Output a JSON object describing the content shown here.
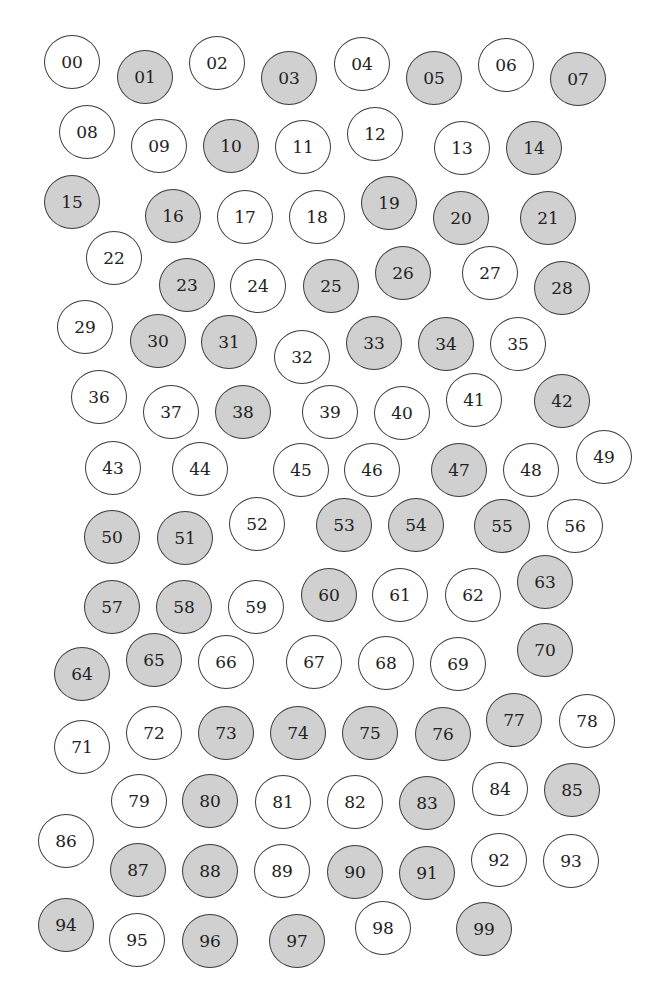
{
  "colors": {
    "background": "#ffffff",
    "shaded_fill": "#d0d0d0",
    "unshaded_fill": "#ffffff",
    "stroke": "#3a3a3a",
    "text": "#222222"
  },
  "circles": [
    {
      "label": "00",
      "x": 72,
      "y": 62,
      "shaded": false
    },
    {
      "label": "01",
      "x": 145,
      "y": 77,
      "shaded": true
    },
    {
      "label": "02",
      "x": 217,
      "y": 63,
      "shaded": false
    },
    {
      "label": "03",
      "x": 289,
      "y": 78,
      "shaded": true
    },
    {
      "label": "04",
      "x": 362,
      "y": 64,
      "shaded": false
    },
    {
      "label": "05",
      "x": 434,
      "y": 78,
      "shaded": true
    },
    {
      "label": "06",
      "x": 506,
      "y": 65,
      "shaded": false
    },
    {
      "label": "07",
      "x": 578,
      "y": 79,
      "shaded": true
    },
    {
      "label": "08",
      "x": 87,
      "y": 132,
      "shaded": false
    },
    {
      "label": "09",
      "x": 159,
      "y": 146,
      "shaded": false
    },
    {
      "label": "10",
      "x": 231,
      "y": 146,
      "shaded": true
    },
    {
      "label": "11",
      "x": 303,
      "y": 147,
      "shaded": false
    },
    {
      "label": "12",
      "x": 375,
      "y": 134,
      "shaded": false
    },
    {
      "label": "13",
      "x": 462,
      "y": 148,
      "shaded": false
    },
    {
      "label": "14",
      "x": 534,
      "y": 148,
      "shaded": true
    },
    {
      "label": "15",
      "x": 72,
      "y": 202,
      "shaded": true
    },
    {
      "label": "16",
      "x": 173,
      "y": 216,
      "shaded": true
    },
    {
      "label": "17",
      "x": 245,
      "y": 217,
      "shaded": false
    },
    {
      "label": "18",
      "x": 317,
      "y": 217,
      "shaded": false
    },
    {
      "label": "19",
      "x": 389,
      "y": 203,
      "shaded": true
    },
    {
      "label": "20",
      "x": 461,
      "y": 218,
      "shaded": true
    },
    {
      "label": "21",
      "x": 548,
      "y": 218,
      "shaded": true
    },
    {
      "label": "22",
      "x": 114,
      "y": 258,
      "shaded": false
    },
    {
      "label": "23",
      "x": 187,
      "y": 285,
      "shaded": true
    },
    {
      "label": "24",
      "x": 258,
      "y": 286,
      "shaded": false
    },
    {
      "label": "25",
      "x": 331,
      "y": 286,
      "shaded": true
    },
    {
      "label": "26",
      "x": 403,
      "y": 273,
      "shaded": true
    },
    {
      "label": "27",
      "x": 490,
      "y": 273,
      "shaded": false
    },
    {
      "label": "28",
      "x": 562,
      "y": 288,
      "shaded": true
    },
    {
      "label": "29",
      "x": 85,
      "y": 327,
      "shaded": false
    },
    {
      "label": "30",
      "x": 158,
      "y": 341,
      "shaded": true
    },
    {
      "label": "31",
      "x": 229,
      "y": 342,
      "shaded": true
    },
    {
      "label": "32",
      "x": 302,
      "y": 357,
      "shaded": false
    },
    {
      "label": "33",
      "x": 374,
      "y": 343,
      "shaded": true
    },
    {
      "label": "34",
      "x": 446,
      "y": 344,
      "shaded": true
    },
    {
      "label": "35",
      "x": 518,
      "y": 344,
      "shaded": false
    },
    {
      "label": "36",
      "x": 99,
      "y": 397,
      "shaded": false
    },
    {
      "label": "37",
      "x": 171,
      "y": 412,
      "shaded": false
    },
    {
      "label": "38",
      "x": 243,
      "y": 412,
      "shaded": true
    },
    {
      "label": "39",
      "x": 330,
      "y": 412,
      "shaded": false
    },
    {
      "label": "40",
      "x": 402,
      "y": 413,
      "shaded": false
    },
    {
      "label": "41",
      "x": 474,
      "y": 400,
      "shaded": false
    },
    {
      "label": "42",
      "x": 562,
      "y": 401,
      "shaded": true
    },
    {
      "label": "43",
      "x": 113,
      "y": 468,
      "shaded": false
    },
    {
      "label": "44",
      "x": 200,
      "y": 469,
      "shaded": false
    },
    {
      "label": "45",
      "x": 301,
      "y": 470,
      "shaded": false
    },
    {
      "label": "46",
      "x": 372,
      "y": 470,
      "shaded": false
    },
    {
      "label": "47",
      "x": 459,
      "y": 470,
      "shaded": true
    },
    {
      "label": "48",
      "x": 531,
      "y": 470,
      "shaded": false
    },
    {
      "label": "49",
      "x": 604,
      "y": 457,
      "shaded": false
    },
    {
      "label": "50",
      "x": 112,
      "y": 537,
      "shaded": true
    },
    {
      "label": "51",
      "x": 185,
      "y": 538,
      "shaded": true
    },
    {
      "label": "52",
      "x": 257,
      "y": 524,
      "shaded": false
    },
    {
      "label": "53",
      "x": 344,
      "y": 525,
      "shaded": true
    },
    {
      "label": "54",
      "x": 416,
      "y": 525,
      "shaded": true
    },
    {
      "label": "55",
      "x": 502,
      "y": 526,
      "shaded": true
    },
    {
      "label": "56",
      "x": 575,
      "y": 526,
      "shaded": false
    },
    {
      "label": "57",
      "x": 112,
      "y": 607,
      "shaded": true
    },
    {
      "label": "58",
      "x": 184,
      "y": 607,
      "shaded": true
    },
    {
      "label": "59",
      "x": 256,
      "y": 607,
      "shaded": false
    },
    {
      "label": "60",
      "x": 329,
      "y": 595,
      "shaded": true
    },
    {
      "label": "61",
      "x": 400,
      "y": 595,
      "shaded": false
    },
    {
      "label": "62",
      "x": 473,
      "y": 595,
      "shaded": false
    },
    {
      "label": "63",
      "x": 545,
      "y": 582,
      "shaded": true
    },
    {
      "label": "64",
      "x": 82,
      "y": 674,
      "shaded": true
    },
    {
      "label": "65",
      "x": 154,
      "y": 660,
      "shaded": true
    },
    {
      "label": "66",
      "x": 226,
      "y": 662,
      "shaded": false
    },
    {
      "label": "67",
      "x": 314,
      "y": 662,
      "shaded": false
    },
    {
      "label": "68",
      "x": 386,
      "y": 663,
      "shaded": false
    },
    {
      "label": "69",
      "x": 458,
      "y": 664,
      "shaded": false
    },
    {
      "label": "70",
      "x": 545,
      "y": 650,
      "shaded": true
    },
    {
      "label": "71",
      "x": 82,
      "y": 747,
      "shaded": false
    },
    {
      "label": "72",
      "x": 154,
      "y": 733,
      "shaded": false
    },
    {
      "label": "73",
      "x": 226,
      "y": 733,
      "shaded": true
    },
    {
      "label": "74",
      "x": 298,
      "y": 733,
      "shaded": true
    },
    {
      "label": "75",
      "x": 370,
      "y": 733,
      "shaded": true
    },
    {
      "label": "76",
      "x": 443,
      "y": 734,
      "shaded": true
    },
    {
      "label": "77",
      "x": 514,
      "y": 720,
      "shaded": true
    },
    {
      "label": "78",
      "x": 587,
      "y": 721,
      "shaded": false
    },
    {
      "label": "79",
      "x": 139,
      "y": 801,
      "shaded": false
    },
    {
      "label": "80",
      "x": 210,
      "y": 801,
      "shaded": true
    },
    {
      "label": "81",
      "x": 283,
      "y": 802,
      "shaded": false
    },
    {
      "label": "82",
      "x": 355,
      "y": 802,
      "shaded": false
    },
    {
      "label": "83",
      "x": 427,
      "y": 803,
      "shaded": true
    },
    {
      "label": "84",
      "x": 500,
      "y": 789,
      "shaded": false
    },
    {
      "label": "85",
      "x": 572,
      "y": 790,
      "shaded": true
    },
    {
      "label": "86",
      "x": 66,
      "y": 841,
      "shaded": false
    },
    {
      "label": "87",
      "x": 138,
      "y": 870,
      "shaded": true
    },
    {
      "label": "88",
      "x": 210,
      "y": 871,
      "shaded": true
    },
    {
      "label": "89",
      "x": 282,
      "y": 871,
      "shaded": false
    },
    {
      "label": "90",
      "x": 355,
      "y": 872,
      "shaded": true
    },
    {
      "label": "91",
      "x": 427,
      "y": 873,
      "shaded": true
    },
    {
      "label": "92",
      "x": 499,
      "y": 860,
      "shaded": false
    },
    {
      "label": "93",
      "x": 571,
      "y": 861,
      "shaded": false
    },
    {
      "label": "94",
      "x": 66,
      "y": 925,
      "shaded": true
    },
    {
      "label": "95",
      "x": 137,
      "y": 940,
      "shaded": false
    },
    {
      "label": "96",
      "x": 210,
      "y": 941,
      "shaded": true
    },
    {
      "label": "97",
      "x": 297,
      "y": 941,
      "shaded": true
    },
    {
      "label": "98",
      "x": 383,
      "y": 928,
      "shaded": false
    },
    {
      "label": "99",
      "x": 484,
      "y": 929,
      "shaded": true
    }
  ]
}
